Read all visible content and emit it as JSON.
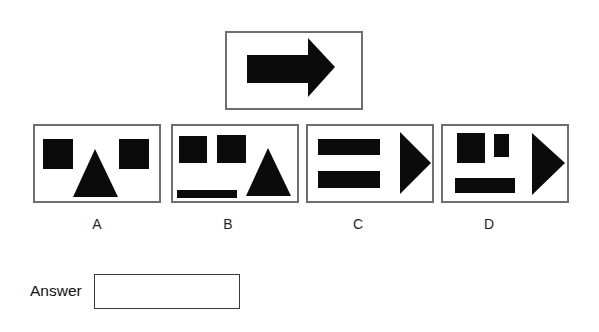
{
  "question": {
    "stimulus": {
      "icon": "right-arrow",
      "shapes": [
        {
          "name": "right-arrow",
          "type": "polygon",
          "points": "20,22 81,22 81,5 108,34 81,64 81,50 20,50"
        }
      ]
    },
    "options": [
      {
        "label": "A",
        "shapes": [
          {
            "name": "square-left",
            "type": "rect",
            "x": 8,
            "y": 13,
            "w": 30,
            "h": 30
          },
          {
            "name": "square-right",
            "type": "rect",
            "x": 84,
            "y": 13,
            "w": 30,
            "h": 30
          },
          {
            "name": "triangle-up",
            "type": "polygon",
            "points": "60,23 83,71 38,71"
          }
        ]
      },
      {
        "label": "B",
        "shapes": [
          {
            "name": "square-left",
            "type": "rect",
            "x": 6,
            "y": 10,
            "w": 28,
            "h": 27
          },
          {
            "name": "square-right",
            "type": "rect",
            "x": 44,
            "y": 9,
            "w": 29,
            "h": 28
          },
          {
            "name": "bar-bottom",
            "type": "rect",
            "x": 4,
            "y": 64,
            "w": 60,
            "h": 8
          },
          {
            "name": "triangle-up",
            "type": "polygon",
            "points": "95,22 118,70 73,70"
          }
        ]
      },
      {
        "label": "C",
        "shapes": [
          {
            "name": "bar-top",
            "type": "rect",
            "x": 10,
            "y": 13,
            "w": 62,
            "h": 16
          },
          {
            "name": "bar-bottom",
            "type": "rect",
            "x": 10,
            "y": 45,
            "w": 62,
            "h": 17
          },
          {
            "name": "triangle-right",
            "type": "polygon",
            "points": "92,6 123,37 92,68"
          }
        ]
      },
      {
        "label": "D",
        "shapes": [
          {
            "name": "square-left",
            "type": "rect",
            "x": 14,
            "y": 7,
            "w": 28,
            "h": 30
          },
          {
            "name": "small-rect",
            "type": "rect",
            "x": 51,
            "y": 8,
            "w": 15,
            "h": 23
          },
          {
            "name": "bar-bottom",
            "type": "rect",
            "x": 12,
            "y": 52,
            "w": 60,
            "h": 15
          },
          {
            "name": "triangle-right",
            "type": "polygon",
            "points": "89,7 122,37 89,69"
          }
        ]
      }
    ],
    "answer": {
      "label": "Answer",
      "value": ""
    }
  },
  "colors": {
    "background": "#ffffff",
    "box_border": "#6e6e6e",
    "shape_fill": "#0b0b0b",
    "answer_border": "#3a3a3a",
    "label_text": "#1f1f1f"
  }
}
